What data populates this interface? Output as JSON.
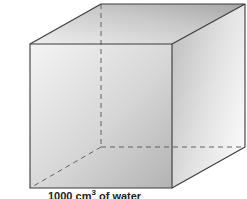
{
  "diagram": {
    "type": "cube",
    "caption": {
      "value": "1000",
      "unit": "cm",
      "exponent": "3",
      "suffix": "of water"
    },
    "colors": {
      "edge": "#3a3a3a",
      "hidden_edge": "#555555",
      "front_face_light": "#f2f2f2",
      "front_face_dark": "#b8b8b8",
      "top_face_light": "#e8e8e8",
      "top_face_dark": "#a9a9a9",
      "side_face_light": "#c9c9c9",
      "side_face_dark": "#f4f4f4"
    }
  }
}
